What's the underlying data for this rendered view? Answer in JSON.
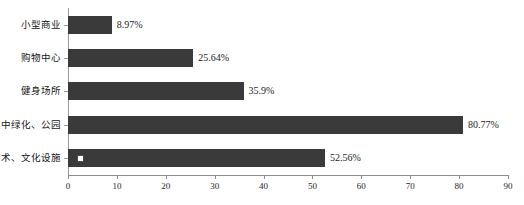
{
  "chart_data": {
    "type": "bar",
    "orientation": "horizontal",
    "title": "",
    "xlabel": "",
    "ylabel": "",
    "xlim": [
      0,
      90
    ],
    "grid": false,
    "legend": false,
    "bar_color": "#3a3a3a",
    "axis_color": "#8d8d8d",
    "categories": [
      "小型商业",
      "购物中心",
      "健身场所",
      "集中绿化、公园",
      "艺术、文化设施"
    ],
    "values": [
      8.97,
      25.64,
      35.9,
      80.77,
      52.56
    ],
    "value_labels": [
      "8.97%",
      "25.64%",
      "35.9%",
      "80.77%",
      "52.56%"
    ],
    "xticks": [
      0,
      10,
      20,
      30,
      40,
      50,
      60,
      70,
      80,
      90
    ],
    "xtick_labels": [
      "0",
      "10",
      "20",
      "30",
      "40",
      "50",
      "60",
      "70",
      "80",
      "90"
    ],
    "annotations": [
      {
        "name": "point-marker",
        "series_index": 4,
        "x_value": 2.5,
        "shape": "square",
        "fill": "#ffffff",
        "stroke": "#4a4a4a"
      }
    ]
  },
  "footer": {
    "note": ""
  }
}
